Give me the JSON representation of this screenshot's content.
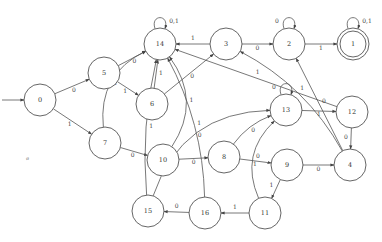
{
  "diagram": {
    "type": "finite-state-automaton",
    "start_state": "0",
    "accepting_states": [
      "1"
    ],
    "node_radius": 16,
    "nodes": [
      {
        "id": "0",
        "label": "0",
        "x": 40,
        "y": 100
      },
      {
        "id": "5",
        "label": "5",
        "x": 104,
        "y": 73
      },
      {
        "id": "7",
        "label": "7",
        "x": 105,
        "y": 143
      },
      {
        "id": "14",
        "label": "14",
        "x": 160,
        "y": 44
      },
      {
        "id": "6",
        "label": "6",
        "x": 152,
        "y": 104
      },
      {
        "id": "10",
        "label": "10",
        "x": 163,
        "y": 160
      },
      {
        "id": "3",
        "label": "3",
        "x": 226,
        "y": 44
      },
      {
        "id": "2",
        "label": "2",
        "x": 289,
        "y": 44
      },
      {
        "id": "1",
        "label": "1",
        "x": 353,
        "y": 44,
        "accepting": true
      },
      {
        "id": "13",
        "label": "13",
        "x": 286,
        "y": 110
      },
      {
        "id": "12",
        "label": "12",
        "x": 352,
        "y": 112
      },
      {
        "id": "8",
        "label": "8",
        "x": 224,
        "y": 157
      },
      {
        "id": "9",
        "label": "9",
        "x": 287,
        "y": 165
      },
      {
        "id": "4",
        "label": "4",
        "x": 350,
        "y": 165
      },
      {
        "id": "15",
        "label": "15",
        "x": 148,
        "y": 211
      },
      {
        "id": "16",
        "label": "16",
        "x": 205,
        "y": 213
      },
      {
        "id": "11",
        "label": "11",
        "x": 265,
        "y": 213
      }
    ],
    "edges": [
      {
        "from": "0",
        "to": "5",
        "label": "0"
      },
      {
        "from": "0",
        "to": "7",
        "label": "1"
      },
      {
        "from": "5",
        "to": "14",
        "label": "0"
      },
      {
        "from": "5",
        "to": "6",
        "label": "1"
      },
      {
        "from": "7",
        "to": "14",
        "label": "1"
      },
      {
        "from": "7",
        "to": "10",
        "label": "0"
      },
      {
        "from": "14",
        "to": "14",
        "label": "0,1"
      },
      {
        "from": "6",
        "to": "14",
        "label": "1"
      },
      {
        "from": "6",
        "to": "3",
        "label": "0"
      },
      {
        "from": "10",
        "to": "14",
        "label": "1"
      },
      {
        "from": "10",
        "to": "8",
        "label": "0"
      },
      {
        "from": "3",
        "to": "14",
        "label": "1"
      },
      {
        "from": "3",
        "to": "2",
        "label": "0"
      },
      {
        "from": "2",
        "to": "2",
        "label": "0"
      },
      {
        "from": "2",
        "to": "1",
        "label": "1"
      },
      {
        "from": "1",
        "to": "1",
        "label": "0,1"
      },
      {
        "from": "13",
        "to": "13",
        "label": "0"
      },
      {
        "from": "13",
        "to": "12",
        "label": "1"
      },
      {
        "from": "12",
        "to": "14",
        "label": "1"
      },
      {
        "from": "12",
        "to": "4",
        "label": "0"
      },
      {
        "from": "8",
        "to": "13",
        "label": "0"
      },
      {
        "from": "8",
        "to": "9",
        "label": "1"
      },
      {
        "from": "9",
        "to": "4",
        "label": "0"
      },
      {
        "from": "9",
        "to": "11",
        "label": "1"
      },
      {
        "from": "4",
        "to": "2",
        "label": "0"
      },
      {
        "from": "4",
        "to": "3",
        "label": "1"
      },
      {
        "from": "11",
        "to": "13",
        "label": "0"
      },
      {
        "from": "11",
        "to": "16",
        "label": "1"
      },
      {
        "from": "16",
        "to": "15",
        "label": "0"
      },
      {
        "from": "16",
        "to": "14",
        "label": "1"
      },
      {
        "from": "15",
        "to": "14",
        "label": "1"
      },
      {
        "from": "15",
        "to": "13",
        "label": "0"
      }
    ],
    "stray_mark": "ø"
  }
}
